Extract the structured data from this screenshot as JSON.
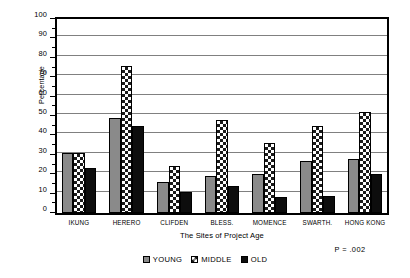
{
  "chart_data": {
    "type": "bar",
    "title": "",
    "xlabel": "The Sites of Project Age",
    "ylabel": "Percentage",
    "ylim": [
      0,
      100
    ],
    "ytick_step": 10,
    "grid": true,
    "grid_axis": "y",
    "legend_position": "bottom-center",
    "orientation": "vertical",
    "grouping": "grouped",
    "categories": [
      "IKUNG",
      "HERERO",
      "CLIFDEN",
      "BLESS.",
      "MOMENCE",
      "SWARTH.",
      "HONG KONG"
    ],
    "ytick_labels": [
      "0",
      "10",
      "20",
      "30",
      "40",
      "50",
      "60",
      "70",
      "80",
      "90",
      "100"
    ],
    "ytick_values": [
      0,
      10,
      20,
      30,
      40,
      50,
      60,
      70,
      80,
      90,
      100
    ],
    "series": [
      {
        "name": "YOUNG",
        "fill": "solid-gray",
        "color": "#8a8a8a",
        "values": [
          31,
          49,
          16,
          19,
          20,
          27,
          28
        ]
      },
      {
        "name": "MIDDLE",
        "fill": "checkered",
        "color": "#ffffff",
        "values": [
          31,
          76,
          24,
          48,
          36,
          45,
          52
        ]
      },
      {
        "name": "OLD",
        "fill": "solid-black",
        "color": "#0d0d0d",
        "values": [
          23,
          45,
          11,
          14,
          8,
          9,
          20
        ]
      }
    ],
    "annotations": [
      {
        "name": "p-value",
        "text": "P = .002"
      }
    ]
  },
  "legend": {
    "items": [
      {
        "label": "YOUNG",
        "key": "young"
      },
      {
        "label": "MIDDLE",
        "key": "middle"
      },
      {
        "label": "OLD",
        "key": "old"
      }
    ]
  }
}
